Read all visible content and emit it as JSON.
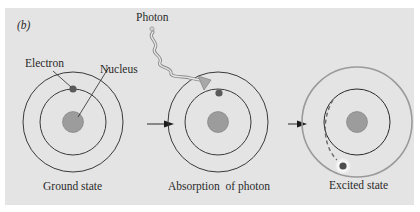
{
  "figure": {
    "panel_label": "(b)",
    "colors": {
      "background": "#e4e4e4",
      "orbit": "#3a3a3a",
      "excited_orbit": "#9a9a9a",
      "nucleus_fill": "#9c9c9c",
      "electron_fill": "#5a5a5a",
      "photon_wave": "#8a8a8a"
    }
  },
  "labels": {
    "electron": "Electron",
    "nucleus": "Nucleus",
    "photon": "Photon"
  },
  "stages": [
    {
      "id": "ground",
      "caption": "Ground state"
    },
    {
      "id": "absorption",
      "caption": "Absorption  of photon"
    },
    {
      "id": "excited",
      "caption": "Excited state"
    }
  ]
}
